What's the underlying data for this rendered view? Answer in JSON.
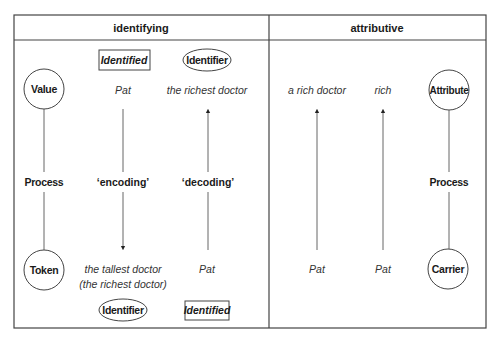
{
  "headers": {
    "identifying": "identifying",
    "attributive": "attributive"
  },
  "roles": {
    "value": "Value",
    "token": "Token",
    "attribute": "Attribute",
    "carrier": "Carrier",
    "process_left": "Process",
    "process_right": "Process"
  },
  "identifying": {
    "col1": {
      "top_tag": "Identified",
      "top_text": "Pat",
      "middle": "‘encoding’",
      "bottom_text_1": "the tallest doctor",
      "bottom_text_2": "(the richest doctor)",
      "bottom_tag": "Identifier",
      "arrow": "down"
    },
    "col2": {
      "top_tag": "Identifier",
      "top_text": "the richest doctor",
      "middle": "‘decoding’",
      "bottom_text": "Pat",
      "bottom_tag": "Identified",
      "arrow": "up"
    }
  },
  "attributive": {
    "col1": {
      "top_text": "a rich doctor",
      "bottom_text": "Pat",
      "arrow": "up"
    },
    "col2": {
      "top_text": "rich",
      "bottom_text": "Pat",
      "arrow": "up"
    }
  }
}
